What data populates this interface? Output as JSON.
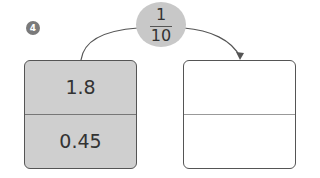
{
  "question_number": "4",
  "operator": {
    "label": "multiply by one tenth",
    "numerator": "1",
    "denominator": "10"
  },
  "left_box": {
    "top": "1.8",
    "bottom": "0.45"
  },
  "right_box": {
    "top": "",
    "bottom": ""
  },
  "colors": {
    "left_fill": "#cfcfcf",
    "circle_fill": "#c8c8c8",
    "badge": "#7a7a7a"
  }
}
